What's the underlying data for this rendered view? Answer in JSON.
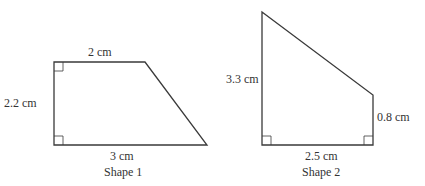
{
  "colors": {
    "stroke": "#3a3a3a",
    "background": "#ffffff",
    "text": "#333333"
  },
  "shape1": {
    "name": "Shape 1",
    "top": "2 cm",
    "left": "2.2 cm",
    "bottom": "3 cm",
    "right_angles": 2
  },
  "shape2": {
    "name": "Shape 2",
    "left": "3.3 cm",
    "right": "0.8 cm",
    "bottom": "2.5 cm",
    "right_angles": 2
  }
}
